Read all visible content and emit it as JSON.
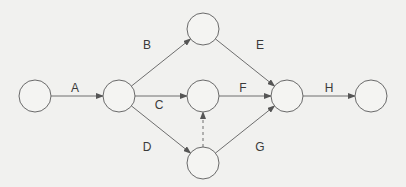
{
  "diagram": {
    "type": "activity-on-arrow network",
    "nodes": [
      {
        "id": "n1",
        "cx": 35,
        "cy": 96
      },
      {
        "id": "n2",
        "cx": 119,
        "cy": 96
      },
      {
        "id": "n3",
        "cx": 203,
        "cy": 29
      },
      {
        "id": "n4",
        "cx": 203,
        "cy": 96
      },
      {
        "id": "n5",
        "cx": 203,
        "cy": 163
      },
      {
        "id": "n6",
        "cx": 287,
        "cy": 96
      },
      {
        "id": "n7",
        "cx": 371,
        "cy": 96
      }
    ],
    "activities": [
      {
        "label": "A",
        "from": "n1",
        "to": "n2",
        "lx": 75,
        "ly": 88
      },
      {
        "label": "B",
        "from": "n2",
        "to": "n3",
        "lx": 147,
        "ly": 45
      },
      {
        "label": "C",
        "from": "n2",
        "to": "n4",
        "lx": 159,
        "ly": 105
      },
      {
        "label": "D",
        "from": "n2",
        "to": "n5",
        "lx": 147,
        "ly": 147
      },
      {
        "label": "E",
        "from": "n3",
        "to": "n6",
        "lx": 260,
        "ly": 45
      },
      {
        "label": "F",
        "from": "n4",
        "to": "n6",
        "lx": 243,
        "ly": 88
      },
      {
        "label": "G",
        "from": "n5",
        "to": "n6",
        "lx": 260,
        "ly": 147
      },
      {
        "label": "H",
        "from": "n6",
        "to": "n7",
        "lx": 329,
        "ly": 88
      }
    ],
    "dummy_activities": [
      {
        "from": "n5",
        "to": "n4",
        "style": "dashed"
      }
    ]
  }
}
